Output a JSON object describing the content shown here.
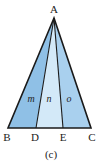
{
  "figure": {
    "caption": "(c)",
    "vertices": {
      "A": "A",
      "B": "B",
      "C": "C",
      "D": "D",
      "E": "E"
    },
    "regions": [
      {
        "label": "m",
        "color": "#8fc0e6"
      },
      {
        "label": "n",
        "color": "#d3e9f8"
      },
      {
        "label": "o",
        "color": "#a9d0ee"
      }
    ],
    "stroke_color": "#1a1a1a"
  }
}
